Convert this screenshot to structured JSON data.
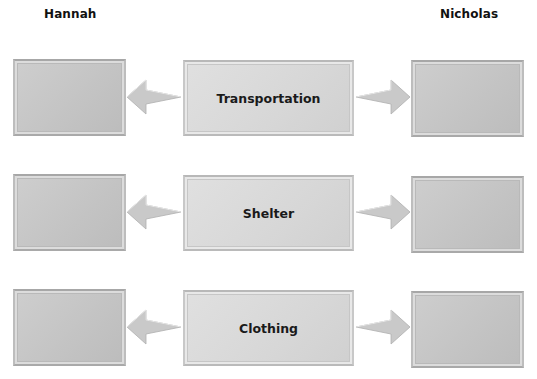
{
  "headers": {
    "left": "Hannah",
    "right": "Nicholas"
  },
  "rows": [
    {
      "category": "Transportation",
      "left_box": "",
      "right_box": ""
    },
    {
      "category": "Shelter",
      "left_box": "",
      "right_box": ""
    },
    {
      "category": "Clothing",
      "left_box": "",
      "right_box": ""
    }
  ],
  "colors": {
    "side_box_fill": "#c6c6c6",
    "center_box_fill": "#d9d9d9",
    "arrow_fill": "#c9c9c9",
    "text": "#111111"
  }
}
